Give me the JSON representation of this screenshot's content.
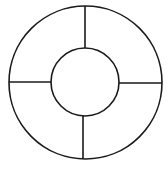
{
  "diagram": {
    "type": "segmented-ring",
    "stroke_color": "#1a1a1a",
    "background": "#ffffff",
    "outer_circle": {
      "cx": 85.5,
      "cy": 82.5,
      "r": 76.5
    },
    "inner_circle": {
      "cx": 85,
      "cy": 82,
      "r": 34
    },
    "dividers": [
      {
        "name": "top",
        "x1": 85,
        "y1": 6,
        "x2": 85,
        "y2": 48
      },
      {
        "name": "left",
        "x1": 9,
        "y1": 82,
        "x2": 51,
        "y2": 82
      },
      {
        "name": "right",
        "x1": 119,
        "y1": 83,
        "x2": 162,
        "y2": 83
      },
      {
        "name": "bottom",
        "x1": 83,
        "y1": 116,
        "x2": 83,
        "y2": 159
      }
    ],
    "segment_count": 4
  }
}
